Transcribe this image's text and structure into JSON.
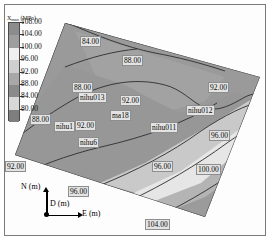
{
  "figure": {
    "kind": "contour-map",
    "background": "#ffffff"
  },
  "legend": {
    "title": "X",
    "title_sub": "max",
    "title_unit": "(MPa)",
    "title_full": "X max (MPa)",
    "ticks": [
      "108.00",
      "104.00",
      "100.00",
      "96.00",
      "92.00",
      "88.00",
      "84.00",
      "80.00"
    ],
    "swatch_colors": [
      "#8c8c8c",
      "#9e9e9e",
      "#efefef",
      "#cfcfcf",
      "#a8a8a8",
      "#8a8a8a",
      "#d8d8d8",
      "#7e7e7e"
    ]
  },
  "axes_indicator": {
    "north_label": "N (m)",
    "east_label": "E (m)",
    "depth_label": "D (m)"
  },
  "contour_labels": [
    {
      "text": "84.00",
      "x": 80,
      "y": 36
    },
    {
      "text": "88.00",
      "x": 122,
      "y": 55
    },
    {
      "text": "88.00",
      "x": 72,
      "y": 82
    },
    {
      "text": "92.00",
      "x": 208,
      "y": 82
    },
    {
      "text": "92.00",
      "x": 120,
      "y": 95
    },
    {
      "text": "88.00",
      "x": 30,
      "y": 114
    },
    {
      "text": "92.00",
      "x": 75,
      "y": 120
    },
    {
      "text": "92.00",
      "x": 5,
      "y": 161
    },
    {
      "text": "96.00",
      "x": 209,
      "y": 130
    },
    {
      "text": "96.00",
      "x": 152,
      "y": 161
    },
    {
      "text": "100.00",
      "x": 196,
      "y": 164
    },
    {
      "text": "96.00",
      "x": 68,
      "y": 186
    },
    {
      "text": "104.00",
      "x": 145,
      "y": 219
    }
  ],
  "well_labels": [
    {
      "text": "nihu013",
      "x": 78,
      "y": 92
    },
    {
      "text": "ma18",
      "x": 110,
      "y": 110
    },
    {
      "text": "nihu012",
      "x": 186,
      "y": 105
    },
    {
      "text": "nihu011",
      "x": 150,
      "y": 122
    },
    {
      "text": "nihu1",
      "x": 54,
      "y": 121
    },
    {
      "text": "nihu6",
      "x": 78,
      "y": 137
    }
  ],
  "chart_data": {
    "type": "heatmap",
    "xlabel": "E (m)",
    "ylabel": "N (m)",
    "zlabel": "X max (MPa)",
    "grid": false,
    "legend_position": "top-left",
    "colorbar_range": [
      80.0,
      108.0
    ],
    "colorbar_step": 4.0,
    "colorbar_ticks": [
      108.0,
      104.0,
      100.0,
      96.0,
      92.0,
      88.0,
      84.0,
      80.0
    ],
    "contour_levels": [
      84.0,
      88.0,
      92.0,
      96.0,
      100.0,
      104.0
    ],
    "wells": [
      {
        "name": "nihu013",
        "value": 88.0
      },
      {
        "name": "ma18",
        "value": 92.0
      },
      {
        "name": "nihu012",
        "value": 92.0
      },
      {
        "name": "nihu011",
        "value": 92.0
      },
      {
        "name": "nihu1",
        "value": 88.0
      },
      {
        "name": "nihu6",
        "value": 92.0
      }
    ]
  }
}
